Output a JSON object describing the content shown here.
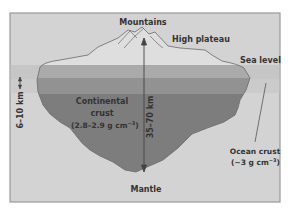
{
  "diagram": {
    "labels": {
      "mountains": "Mountains",
      "high_plateau": "High plateau",
      "sea_level": "Sea level",
      "continental_line1": "Continental",
      "continental_line2": "crust",
      "continental_density": "(2.8–2.9 g cm",
      "continental_density_exp": "−3",
      "continental_density_close": ")",
      "crust_thickness": "35–70 km",
      "ocean_depth": "6–10 km",
      "ocean_line1": "Ocean crust",
      "ocean_density": "(~3 g cm",
      "ocean_density_exp": "−3",
      "ocean_density_close": ")",
      "mantle": "Mantle"
    },
    "colors": {
      "background": "#d2d2d2",
      "sea": "#c4c4c4",
      "mountain_fill": "#dcdcdc",
      "band_light": "#a9a9a9",
      "band_mid": "#8e8e8e",
      "crust_dark": "#7c7c7c",
      "line": "#555555",
      "frame": "#9a9a9a"
    }
  }
}
